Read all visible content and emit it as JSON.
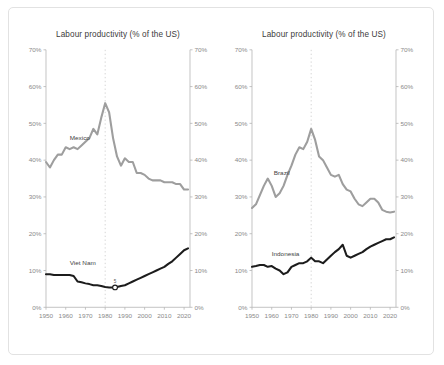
{
  "figure": {
    "background_color": "#ffffff",
    "border_color": "#e2e2e2"
  },
  "style": {
    "light_series_color": "#9e9e9e",
    "dark_series_color": "#1c1c1c",
    "axis_color": "#b4b4b4",
    "axis_text_color": "#8a8a8a",
    "reference_line_color": "#cfcfcf",
    "title_color": "#3c3c3c"
  },
  "chart_data": [
    {
      "type": "line",
      "panel": "left",
      "title": "Labour productivity (% of the US)",
      "xlabel": "",
      "ylabel": "",
      "xlim": [
        1950,
        2023
      ],
      "ylim": [
        0,
        70
      ],
      "ytick_labels": [
        "0%",
        "10%",
        "20%",
        "30%",
        "40%",
        "50%",
        "60%",
        "70%"
      ],
      "ytick_values": [
        0,
        10,
        20,
        30,
        40,
        50,
        60,
        70
      ],
      "xtick_labels": [
        "1950",
        "1960",
        "1970",
        "1980",
        "1990",
        "2000",
        "2010",
        "2020"
      ],
      "xtick_values": [
        1950,
        1960,
        1970,
        1980,
        1990,
        2000,
        2010,
        2020
      ],
      "grid": false,
      "legend": "inline-labels",
      "reference_line_x": 1980,
      "annotations": [
        {
          "label": "5",
          "x": 1985,
          "y": 5.4,
          "marker": "open-circle"
        }
      ],
      "series": [
        {
          "name": "Mexico",
          "color": "#9e9e9e",
          "label_x": 1962,
          "label_y": 45.5,
          "x": [
            1950,
            1952,
            1954,
            1956,
            1958,
            1960,
            1962,
            1964,
            1966,
            1968,
            1970,
            1972,
            1974,
            1976,
            1978,
            1980,
            1982,
            1984,
            1986,
            1988,
            1990,
            1992,
            1994,
            1996,
            1998,
            2000,
            2002,
            2004,
            2006,
            2008,
            2010,
            2012,
            2014,
            2016,
            2018,
            2020,
            2022
          ],
          "values": [
            39.5,
            38.0,
            40.0,
            41.5,
            41.5,
            43.5,
            43.0,
            43.5,
            43.0,
            44.0,
            45.0,
            46.0,
            48.5,
            47.0,
            51.5,
            55.5,
            53.0,
            46.0,
            41.0,
            38.5,
            40.5,
            39.5,
            39.5,
            36.5,
            36.5,
            36.0,
            35.0,
            34.5,
            34.5,
            34.5,
            34.0,
            34.0,
            34.0,
            33.5,
            33.5,
            32.0,
            32.0
          ]
        },
        {
          "name": "Viet Nam",
          "color": "#1c1c1c",
          "label_x": 1962,
          "label_y": 11.5,
          "x": [
            1950,
            1952,
            1954,
            1956,
            1958,
            1960,
            1962,
            1964,
            1966,
            1968,
            1970,
            1972,
            1974,
            1976,
            1978,
            1980,
            1982,
            1984,
            1986,
            1988,
            1990,
            1992,
            1994,
            1996,
            1998,
            2000,
            2002,
            2004,
            2006,
            2008,
            2010,
            2012,
            2014,
            2016,
            2018,
            2020,
            2022
          ],
          "values": [
            9.0,
            9.0,
            8.8,
            8.8,
            8.8,
            8.8,
            8.8,
            8.5,
            7.0,
            6.8,
            6.5,
            6.3,
            6.0,
            6.0,
            5.8,
            5.5,
            5.4,
            5.4,
            5.5,
            5.8,
            6.0,
            6.5,
            7.0,
            7.5,
            8.0,
            8.5,
            9.0,
            9.5,
            10.0,
            10.5,
            11.0,
            11.8,
            12.5,
            13.5,
            14.5,
            15.5,
            16.0
          ]
        }
      ]
    },
    {
      "type": "line",
      "panel": "right",
      "title": "Labour productivity (% of the US)",
      "xlabel": "",
      "ylabel": "",
      "xlim": [
        1950,
        2023
      ],
      "ylim": [
        0,
        70
      ],
      "ytick_labels": [
        "0%",
        "10%",
        "20%",
        "30%",
        "40%",
        "50%",
        "60%",
        "70%"
      ],
      "ytick_values": [
        0,
        10,
        20,
        30,
        40,
        50,
        60,
        70
      ],
      "xtick_labels": [
        "1950",
        "1960",
        "1970",
        "1980",
        "1990",
        "2000",
        "2010",
        "2020"
      ],
      "xtick_values": [
        1950,
        1960,
        1970,
        1980,
        1990,
        2000,
        2010,
        2020
      ],
      "grid": false,
      "legend": "inline-labels",
      "reference_line_x": 1980,
      "annotations": [],
      "series": [
        {
          "name": "Brazil",
          "color": "#9e9e9e",
          "label_x": 1961,
          "label_y": 36.0,
          "x": [
            1950,
            1952,
            1954,
            1956,
            1958,
            1960,
            1962,
            1964,
            1966,
            1968,
            1970,
            1972,
            1974,
            1976,
            1978,
            1980,
            1982,
            1984,
            1986,
            1988,
            1990,
            1992,
            1994,
            1996,
            1998,
            2000,
            2002,
            2004,
            2006,
            2008,
            2010,
            2012,
            2014,
            2016,
            2018,
            2020,
            2022
          ],
          "values": [
            27.0,
            28.0,
            30.5,
            33.0,
            35.0,
            33.0,
            30.0,
            31.0,
            33.0,
            36.0,
            38.5,
            41.5,
            43.5,
            43.0,
            45.0,
            48.5,
            45.5,
            41.0,
            40.0,
            38.0,
            36.0,
            35.5,
            36.0,
            33.5,
            32.0,
            31.5,
            29.5,
            28.0,
            27.5,
            28.5,
            29.5,
            29.5,
            28.5,
            26.5,
            26.0,
            25.8,
            26.0
          ]
        },
        {
          "name": "Indonesia",
          "color": "#1c1c1c",
          "label_x": 1960,
          "label_y": 14.0,
          "x": [
            1950,
            1952,
            1954,
            1956,
            1958,
            1960,
            1962,
            1964,
            1966,
            1968,
            1970,
            1972,
            1974,
            1976,
            1978,
            1980,
            1982,
            1984,
            1986,
            1988,
            1990,
            1992,
            1994,
            1996,
            1998,
            2000,
            2002,
            2004,
            2006,
            2008,
            2010,
            2012,
            2014,
            2016,
            2018,
            2020,
            2022
          ],
          "values": [
            11.0,
            11.2,
            11.5,
            11.5,
            11.0,
            11.2,
            10.5,
            10.0,
            9.0,
            9.5,
            11.0,
            11.5,
            12.0,
            12.0,
            12.5,
            13.5,
            12.5,
            12.5,
            12.0,
            13.0,
            14.0,
            15.0,
            15.8,
            17.0,
            14.0,
            13.5,
            14.0,
            14.5,
            15.0,
            15.8,
            16.5,
            17.0,
            17.5,
            18.0,
            18.5,
            18.5,
            19.0
          ]
        }
      ]
    }
  ]
}
